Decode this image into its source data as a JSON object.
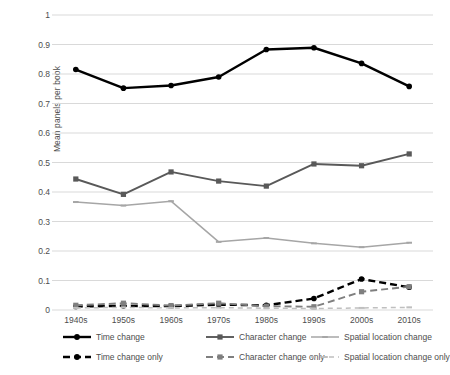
{
  "chart_data": {
    "type": "line",
    "title": "",
    "xlabel": "",
    "ylabel": "Mean panels per book",
    "categories": [
      "1940s",
      "1950s",
      "1960s",
      "1970s",
      "1980s",
      "1990s",
      "2000s",
      "2010s"
    ],
    "ylim": [
      0,
      1
    ],
    "ytick_labels": [
      "1",
      "0.9",
      "0.8",
      "0.7",
      "0.6",
      "0.5",
      "0.4",
      "0.3",
      "0.2",
      "0.1",
      "0"
    ],
    "ytick_values": [
      1,
      0.9,
      0.8,
      0.7,
      0.6,
      0.5,
      0.4,
      0.3,
      0.2,
      0.1,
      0
    ],
    "grid": true,
    "legend_position": "bottom",
    "series": [
      {
        "name": "Time change",
        "color": "#000000",
        "marker": "circle",
        "dash": "solid",
        "values": [
          0.815,
          0.752,
          0.761,
          0.79,
          0.883,
          0.889,
          0.836,
          0.758
        ]
      },
      {
        "name": "Character change",
        "color": "#595959",
        "marker": "square",
        "dash": "solid",
        "values": [
          0.444,
          0.392,
          0.468,
          0.437,
          0.42,
          0.495,
          0.489,
          0.529
        ]
      },
      {
        "name": "Spatial location change",
        "color": "#a6a6a6",
        "marker": "line",
        "dash": "solid",
        "values": [
          0.366,
          0.354,
          0.369,
          0.231,
          0.244,
          0.226,
          0.213,
          0.228
        ]
      },
      {
        "name": "Time change only",
        "color": "#000000",
        "marker": "circle",
        "dash": "dashed",
        "values": [
          0.012,
          0.014,
          0.013,
          0.018,
          0.016,
          0.039,
          0.105,
          0.077
        ]
      },
      {
        "name": "Character change only",
        "color": "#7f7f7f",
        "marker": "square",
        "dash": "dashed",
        "values": [
          0.016,
          0.023,
          0.015,
          0.023,
          0.013,
          0.011,
          0.062,
          0.079
        ]
      },
      {
        "name": "Spatial location change only",
        "color": "#bfbfbf",
        "marker": "line",
        "dash": "dashed",
        "values": [
          0.007,
          0.009,
          0.007,
          0.008,
          0.006,
          0.005,
          0.007,
          0.009
        ]
      }
    ]
  },
  "axis": {
    "y_title": "Mean panels per book"
  },
  "legend": {
    "items": [
      {
        "label": "Time change",
        "color": "#000000",
        "dash": "solid",
        "marker": "circle"
      },
      {
        "label": "Character change",
        "color": "#595959",
        "dash": "solid",
        "marker": "square"
      },
      {
        "label": "Spatial location change",
        "color": "#a6a6a6",
        "dash": "solid",
        "marker": "line"
      },
      {
        "label": "Time change only",
        "color": "#000000",
        "dash": "dashed",
        "marker": "circle"
      },
      {
        "label": "Character change only",
        "color": "#7f7f7f",
        "dash": "dashed",
        "marker": "square"
      },
      {
        "label": "Spatial location change only",
        "color": "#bfbfbf",
        "dash": "dashed",
        "marker": "line"
      }
    ]
  },
  "colors": {
    "grid": "#d9d9d9",
    "text": "#4d4d4d",
    "background": "#ffffff"
  }
}
